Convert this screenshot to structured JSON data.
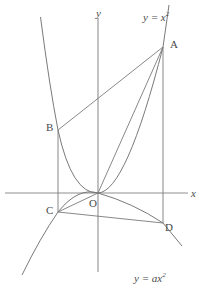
{
  "figure": {
    "background_color": "#ffffff",
    "stroke_color": "#6f6f6f",
    "axis_color": "#8a8a8a",
    "label_color": "#4a4a4a"
  },
  "axes": {
    "x_label": "x",
    "y_label": "y",
    "origin_label": "O",
    "x_axis": {
      "y": 193,
      "x_start": 5,
      "x_end": 188
    },
    "y_axis": {
      "x": 98,
      "y_start": 18,
      "y_end": 272
    }
  },
  "curves": [
    {
      "name": "upward-parabola",
      "label": "y = x",
      "exponent": "2",
      "equation": "y = x^2",
      "a": 1,
      "opens": "up",
      "vertex": [
        0,
        0
      ]
    },
    {
      "name": "downward-parabola",
      "label": "y = ax",
      "exponent": "2",
      "equation": "y = ax^2",
      "a": "a",
      "opens": "down",
      "vertex": [
        0,
        0
      ]
    }
  ],
  "points": [
    {
      "name": "A",
      "label": "A",
      "x": 163,
      "y": 47,
      "on": "upward-parabola"
    },
    {
      "name": "B",
      "label": "B",
      "x": 58,
      "y": 130,
      "on": "upward-parabola"
    },
    {
      "name": "C",
      "label": "C",
      "x": 58,
      "y": 212,
      "on": "downward-parabola"
    },
    {
      "name": "D",
      "label": "D",
      "x": 163,
      "y": 223,
      "on": "downward-parabola"
    },
    {
      "name": "O",
      "label": "O",
      "x": 98,
      "y": 193,
      "on": "origin"
    }
  ],
  "segments": [
    {
      "name": "segment-AB",
      "from": "B",
      "to": "A"
    },
    {
      "name": "segment-AD",
      "from": "A",
      "to": "D"
    },
    {
      "name": "segment-BC",
      "from": "B",
      "to": "C"
    },
    {
      "name": "segment-CD",
      "from": "C",
      "to": "D"
    },
    {
      "name": "segment-CO",
      "from": "C",
      "to": "O"
    },
    {
      "name": "segment-OA",
      "from": "O",
      "to": "A"
    }
  ],
  "equations": {
    "upper": {
      "text": "y = x",
      "sup": "2",
      "x": 143,
      "y": 10
    },
    "lower": {
      "text": "y = ax",
      "sup": "2",
      "x": 134,
      "y": 271
    }
  }
}
